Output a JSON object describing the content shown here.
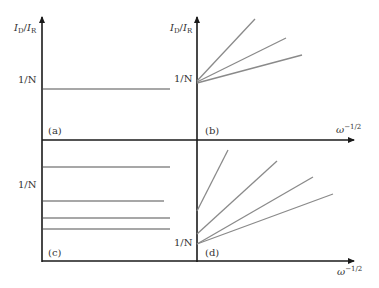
{
  "figure": {
    "colors": {
      "axis": "#1a1a1a",
      "line": "#8a8a8a",
      "text": "#333333"
    },
    "y_axis_label": {
      "main": "I",
      "sub1": "D",
      "slash": "/",
      "main2": "I",
      "sub2": "R"
    },
    "x_axis_label": {
      "base": "ω",
      "exp": "−1/2"
    },
    "tick_label": "1/N",
    "panels": [
      {
        "id": "a",
        "label": "(a)",
        "lines": [
          {
            "type": "horizontal",
            "level": "1/N"
          }
        ]
      },
      {
        "id": "b",
        "label": "(b)",
        "lines": [
          {
            "type": "linear",
            "intercept": "1/N",
            "slope": "steep"
          },
          {
            "type": "linear",
            "intercept": "1/N",
            "slope": "medium"
          },
          {
            "type": "linear",
            "intercept": "1/N",
            "slope": "shallow"
          }
        ]
      },
      {
        "id": "c",
        "label": "(c)",
        "lines": [
          {
            "type": "horizontal",
            "level": "above 1/N"
          },
          {
            "type": "horizontal",
            "level": "below 1/N"
          },
          {
            "type": "horizontal",
            "level": "below 1/N"
          },
          {
            "type": "horizontal",
            "level": "below 1/N"
          }
        ]
      },
      {
        "id": "d",
        "label": "(d)",
        "lines": [
          {
            "type": "linear",
            "intercept": "above 1/N",
            "slope": "steepest"
          },
          {
            "type": "linear",
            "intercept": "above 1/N",
            "slope": "steep"
          },
          {
            "type": "linear",
            "intercept": "1/N",
            "slope": "medium"
          },
          {
            "type": "linear",
            "intercept": "1/N",
            "slope": "shallow"
          }
        ]
      }
    ]
  }
}
